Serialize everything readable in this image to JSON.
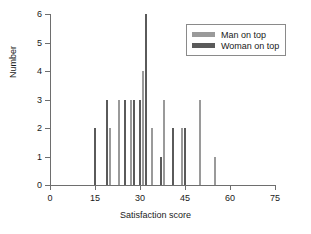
{
  "chart_data": {
    "type": "bar",
    "title": "",
    "subtitle": "",
    "xlabel": "Satisfaction score",
    "ylabel": "Number",
    "xlim": [
      0,
      75
    ],
    "ylim": [
      0,
      6
    ],
    "xticks": [
      0,
      15,
      30,
      45,
      60,
      75
    ],
    "yticks": [
      0,
      1,
      2,
      3,
      4,
      5,
      6
    ],
    "grid": false,
    "legend_position": "top-right",
    "annotations": [],
    "series": [
      {
        "name": "Man on top",
        "color": "#9a9a9a",
        "points": [
          {
            "x": 20,
            "y": 2
          },
          {
            "x": 23,
            "y": 3
          },
          {
            "x": 27,
            "y": 3
          },
          {
            "x": 31,
            "y": 4
          },
          {
            "x": 34,
            "y": 2
          },
          {
            "x": 38,
            "y": 3
          },
          {
            "x": 44,
            "y": 2
          },
          {
            "x": 50,
            "y": 3
          },
          {
            "x": 55,
            "y": 1
          }
        ]
      },
      {
        "name": "Woman on top",
        "color": "#5a5a5a",
        "points": [
          {
            "x": 15,
            "y": 2
          },
          {
            "x": 19,
            "y": 3
          },
          {
            "x": 25,
            "y": 3
          },
          {
            "x": 28,
            "y": 3
          },
          {
            "x": 30,
            "y": 3
          },
          {
            "x": 32,
            "y": 6
          },
          {
            "x": 37,
            "y": 1
          },
          {
            "x": 41,
            "y": 2
          },
          {
            "x": 45,
            "y": 2
          }
        ]
      }
    ]
  },
  "legend": {
    "entries": [
      {
        "label": "Man on top",
        "color": "#9a9a9a"
      },
      {
        "label": "Woman on top",
        "color": "#5a5a5a"
      }
    ]
  },
  "axes": {
    "x_title": "Satisfaction score",
    "y_title": "Number",
    "x_tick_labels": [
      "0",
      "15",
      "30",
      "45",
      "60",
      "75"
    ],
    "y_tick_labels": [
      "0",
      "1",
      "2",
      "3",
      "4",
      "5",
      "6"
    ]
  }
}
